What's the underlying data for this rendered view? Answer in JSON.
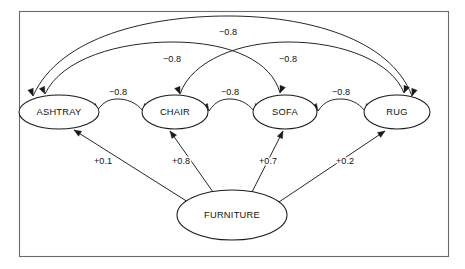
{
  "figure": {
    "type": "semantic-network-diagram",
    "frame": {
      "visible": true,
      "color": "#6b6b6b"
    },
    "background": "#ffffff",
    "line_color": "#1a1a1a",
    "text_color": "#111111"
  },
  "nodes": [
    {
      "id": "ashtray",
      "label": "ASHTRAY",
      "cx": 59,
      "cy": 112,
      "rx": 40,
      "ry": 17
    },
    {
      "id": "chair",
      "label": "CHAIR",
      "cx": 175,
      "cy": 112,
      "rx": 33,
      "ry": 17
    },
    {
      "id": "sofa",
      "label": "SOFA",
      "cx": 285,
      "cy": 112,
      "rx": 32,
      "ry": 17
    },
    {
      "id": "rug",
      "label": "RUG",
      "cx": 397,
      "cy": 112,
      "rx": 33,
      "ry": 17
    },
    {
      "id": "furniture",
      "label": "FURNITURE",
      "cx": 232,
      "cy": 215,
      "rx": 55,
      "ry": 25
    }
  ],
  "edges": [
    {
      "id": "ashtray-rug",
      "from": "ashtray",
      "to": "rug",
      "weight": "−0.8",
      "sign": "negative",
      "style": "arc-bidirectional",
      "label_x": 228,
      "label_y": 33,
      "path": "M 33 96 C 60 36 150 16 228 16 C 306 16 390 38 412 96",
      "arrow_start": {
        "x": 33,
        "y": 96,
        "angle": 70
      },
      "arrow_end": {
        "x": 412,
        "y": 96,
        "angle": 110
      }
    },
    {
      "id": "ashtray-sofa",
      "from": "ashtray",
      "to": "sofa",
      "weight": "−0.8",
      "sign": "negative",
      "style": "arc-bidirectional",
      "label_x": 172,
      "label_y": 60,
      "path": "M 45 94 C 62 58 120 42 172 42 C 232 42 272 62 280 93",
      "arrow_start": {
        "x": 45,
        "y": 94,
        "angle": 65
      },
      "arrow_end": {
        "x": 280,
        "y": 93,
        "angle": 112
      }
    },
    {
      "id": "chair-rug",
      "from": "chair",
      "to": "rug",
      "weight": "−0.8",
      "sign": "negative",
      "style": "arc-bidirectional",
      "label_x": 288,
      "label_y": 60,
      "path": "M 180 94 C 192 60 240 42 288 42 C 344 42 392 62 404 93",
      "arrow_start": {
        "x": 180,
        "y": 94,
        "angle": 68
      },
      "arrow_end": {
        "x": 404,
        "y": 93,
        "angle": 112
      }
    },
    {
      "id": "ashtray-chair",
      "from": "ashtray",
      "to": "chair",
      "weight": "−0.8",
      "sign": "negative",
      "style": "arc-bidirectional",
      "label_x": 118,
      "label_y": 93,
      "path": "M 97 111 C 104 100 112 99 118 99 C 126 99 136 102 143 111",
      "arrow_start": {
        "x": 97,
        "y": 111,
        "angle": 57
      },
      "arrow_end": {
        "x": 143,
        "y": 111,
        "angle": 123
      }
    },
    {
      "id": "chair-sofa",
      "from": "chair",
      "to": "sofa",
      "weight": "−0.8",
      "sign": "negative",
      "style": "arc-bidirectional",
      "label_x": 230,
      "label_y": 93,
      "path": "M 209 111 C 216 100 224 99 230 99 C 238 99 247 102 254 111",
      "arrow_start": {
        "x": 209,
        "y": 111,
        "angle": 57
      },
      "arrow_end": {
        "x": 254,
        "y": 111,
        "angle": 123
      }
    },
    {
      "id": "sofa-rug",
      "from": "sofa",
      "to": "rug",
      "weight": "−0.8",
      "sign": "negative",
      "style": "arc-bidirectional",
      "label_x": 341,
      "label_y": 93,
      "path": "M 318 111 C 325 100 334 99 341 99 C 349 99 358 102 365 111",
      "arrow_start": {
        "x": 318,
        "y": 111,
        "angle": 57
      },
      "arrow_end": {
        "x": 365,
        "y": 111,
        "angle": 123
      }
    },
    {
      "id": "furniture-ashtray",
      "from": "furniture",
      "to": "ashtray",
      "weight": "+0.1",
      "sign": "positive",
      "style": "straight-arrow",
      "label_x": 103,
      "label_y": 162,
      "path": "M 188 202 L 74 130",
      "arrow_end": {
        "x": 74,
        "y": 130,
        "angle": 212
      }
    },
    {
      "id": "furniture-chair",
      "from": "furniture",
      "to": "chair",
      "weight": "+0.8",
      "sign": "positive",
      "style": "straight-arrow",
      "label_x": 181,
      "label_y": 162,
      "path": "M 213 192 L 170 131",
      "arrow_end": {
        "x": 170,
        "y": 131,
        "angle": 234
      }
    },
    {
      "id": "furniture-sofa",
      "from": "furniture",
      "to": "sofa",
      "weight": "+0.7",
      "sign": "positive",
      "style": "straight-arrow",
      "label_x": 268,
      "label_y": 162,
      "path": "M 252 192 L 283 131",
      "arrow_end": {
        "x": 283,
        "y": 131,
        "angle": 296
      }
    },
    {
      "id": "furniture-rug",
      "from": "furniture",
      "to": "rug",
      "weight": "+0.2",
      "sign": "positive",
      "style": "straight-arrow",
      "label_x": 345,
      "label_y": 162,
      "path": "M 279 202 L 385 131",
      "arrow_end": {
        "x": 385,
        "y": 131,
        "angle": 326
      }
    }
  ]
}
